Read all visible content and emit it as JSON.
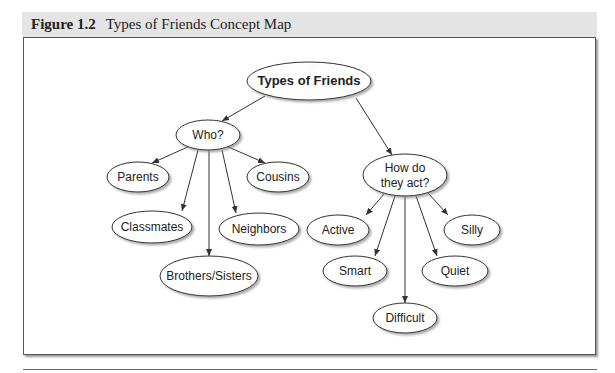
{
  "caption": {
    "figure_number": "Figure 1.2",
    "title": "Types of Friends Concept Map"
  },
  "diagram": {
    "root": {
      "id": "root",
      "label": "Types of Friends",
      "cx": 309,
      "cy": 81,
      "rx": 62,
      "ry": 19
    },
    "nodes": [
      {
        "id": "who",
        "lines": [
          "Who?"
        ],
        "cx": 208,
        "cy": 135,
        "rx": 32,
        "ry": 15
      },
      {
        "id": "how",
        "lines": [
          "How do",
          "they act?"
        ],
        "cx": 405,
        "cy": 175,
        "rx": 42,
        "ry": 21
      },
      {
        "id": "parents",
        "lines": [
          "Parents"
        ],
        "cx": 138,
        "cy": 177,
        "rx": 31,
        "ry": 15
      },
      {
        "id": "cousins",
        "lines": [
          "Cousins"
        ],
        "cx": 278,
        "cy": 177,
        "rx": 31,
        "ry": 15
      },
      {
        "id": "classmates",
        "lines": [
          "Classmates"
        ],
        "cx": 152,
        "cy": 227,
        "rx": 40,
        "ry": 16
      },
      {
        "id": "neighbors",
        "lines": [
          "Neighbors"
        ],
        "cx": 259,
        "cy": 229,
        "rx": 40,
        "ry": 16
      },
      {
        "id": "brothers_sisters",
        "lines": [
          "Brothers/Sisters"
        ],
        "cx": 209,
        "cy": 276,
        "rx": 49,
        "ry": 20
      },
      {
        "id": "active",
        "lines": [
          "Active"
        ],
        "cx": 338,
        "cy": 230,
        "rx": 31,
        "ry": 15
      },
      {
        "id": "silly",
        "lines": [
          "Silly"
        ],
        "cx": 472,
        "cy": 230,
        "rx": 28,
        "ry": 15
      },
      {
        "id": "smart",
        "lines": [
          "Smart"
        ],
        "cx": 355,
        "cy": 271,
        "rx": 32,
        "ry": 15
      },
      {
        "id": "quiet",
        "lines": [
          "Quiet"
        ],
        "cx": 455,
        "cy": 271,
        "rx": 33,
        "ry": 15
      },
      {
        "id": "difficult",
        "lines": [
          "Difficult"
        ],
        "cx": 405,
        "cy": 318,
        "rx": 32,
        "ry": 15
      }
    ],
    "edges": [
      {
        "from": "root",
        "to": "who",
        "x1": 265,
        "y1": 96,
        "x2": 222,
        "y2": 121
      },
      {
        "from": "root",
        "to": "how",
        "x1": 356,
        "y1": 98,
        "x2": 392,
        "y2": 155
      },
      {
        "from": "who",
        "to": "parents",
        "x1": 190,
        "y1": 146,
        "x2": 152,
        "y2": 163
      },
      {
        "from": "who",
        "to": "cousins",
        "x1": 226,
        "y1": 146,
        "x2": 265,
        "y2": 163
      },
      {
        "from": "who",
        "to": "classmates",
        "x1": 198,
        "y1": 150,
        "x2": 182,
        "y2": 211
      },
      {
        "from": "who",
        "to": "brothers_sisters",
        "x1": 209,
        "y1": 150,
        "x2": 209,
        "y2": 256
      },
      {
        "from": "who",
        "to": "neighbors",
        "x1": 222,
        "y1": 150,
        "x2": 236,
        "y2": 213
      },
      {
        "from": "how",
        "to": "active",
        "x1": 384,
        "y1": 194,
        "x2": 366,
        "y2": 215
      },
      {
        "from": "how",
        "to": "smart",
        "x1": 395,
        "y1": 196,
        "x2": 375,
        "y2": 256
      },
      {
        "from": "how",
        "to": "difficult",
        "x1": 405,
        "y1": 196,
        "x2": 405,
        "y2": 303
      },
      {
        "from": "how",
        "to": "quiet",
        "x1": 416,
        "y1": 196,
        "x2": 437,
        "y2": 256
      },
      {
        "from": "how",
        "to": "silly",
        "x1": 428,
        "y1": 193,
        "x2": 448,
        "y2": 215
      }
    ]
  }
}
